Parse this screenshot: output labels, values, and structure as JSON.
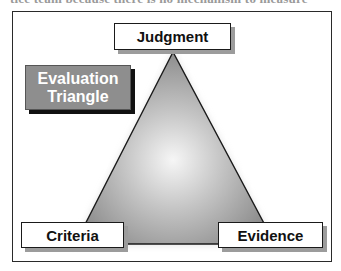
{
  "page": {
    "cutoff_text": "tice team because there is no mechanism to measure"
  },
  "diagram": {
    "title_line1": "Evaluation",
    "title_line2": "Triangle",
    "vertices": {
      "top": "Judgment",
      "bottom_left": "Criteria",
      "bottom_right": "Evidence"
    },
    "colors": {
      "triangle_center": "#f4f4f4",
      "triangle_edge": "#8a8a8a",
      "title_box_fill": "#8e8e8e",
      "title_text": "#ffffff",
      "outline": "#1a1a1a"
    }
  }
}
